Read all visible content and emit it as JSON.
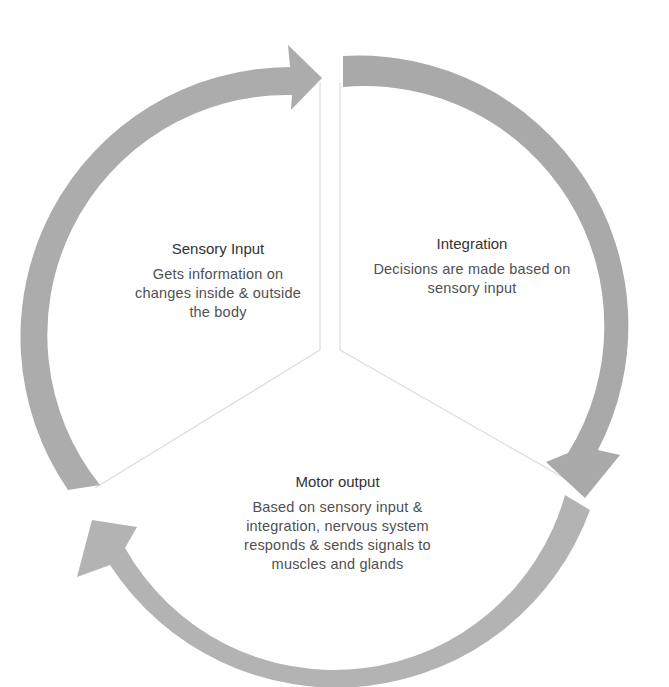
{
  "diagram": {
    "type": "cycle",
    "colors": {
      "arrow": "#aaaaaa",
      "divider": "#d8d8d8",
      "title": "#333333",
      "body": "#505050"
    },
    "segments": [
      {
        "id": "sensory",
        "title": "Sensory Input",
        "body": "Gets information on changes inside & outside the body"
      },
      {
        "id": "integration",
        "title": "Integration",
        "body": "Decisions are made based on sensory input"
      },
      {
        "id": "motor",
        "title": "Motor output",
        "body": "Based on sensory input & integration, nervous system responds & sends signals to muscles and glands"
      }
    ],
    "arrows": [
      {
        "from": "Sensory Input",
        "to": "Integration",
        "direction": "clockwise"
      },
      {
        "from": "Integration",
        "to": "Motor output",
        "direction": "clockwise"
      },
      {
        "from": "Motor output",
        "to": "Sensory Input",
        "direction": "clockwise"
      }
    ]
  }
}
